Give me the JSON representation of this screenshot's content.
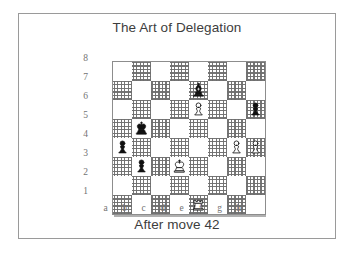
{
  "figure": {
    "title": "The Art of Delegation",
    "caption": "After move 42"
  },
  "board": {
    "files": [
      "a",
      "b",
      "c",
      "d",
      "e",
      "f",
      "g",
      "h"
    ],
    "ranks": [
      "8",
      "7",
      "6",
      "5",
      "4",
      "3",
      "2",
      "1"
    ],
    "light_square_color": "#ffffff",
    "dark_square_color": "#b8b8b8",
    "border_color": "#8d8d8d",
    "orientation": "white"
  },
  "chart_data": {
    "type": "table",
    "title": "The Art of Delegation",
    "subtitle": "After move 42",
    "xlabel": "file",
    "ylabel": "rank",
    "categories": [
      "a",
      "b",
      "c",
      "d",
      "e",
      "f",
      "g",
      "h"
    ],
    "x": [
      "a",
      "b",
      "c",
      "d",
      "e",
      "f",
      "g",
      "h"
    ],
    "values": [
      8,
      7,
      6,
      5,
      4,
      3,
      2,
      1
    ],
    "grid": true,
    "legend": "none",
    "pieces": [
      {
        "square": "e7",
        "file": "e",
        "rank": 7,
        "color": "black",
        "type": "bishop",
        "glyph": "♝"
      },
      {
        "square": "e6",
        "file": "e",
        "rank": 6,
        "color": "white",
        "type": "pawn",
        "glyph": "♙"
      },
      {
        "square": "h6",
        "file": "h",
        "rank": 6,
        "color": "black",
        "type": "pawn",
        "glyph": "♟"
      },
      {
        "square": "b5",
        "file": "b",
        "rank": 5,
        "color": "black",
        "type": "king",
        "glyph": "♚"
      },
      {
        "square": "a4",
        "file": "a",
        "rank": 4,
        "color": "black",
        "type": "pawn",
        "glyph": "♟"
      },
      {
        "square": "g4",
        "file": "g",
        "rank": 4,
        "color": "white",
        "type": "pawn",
        "glyph": "♙"
      },
      {
        "square": "h4",
        "file": "h",
        "rank": 4,
        "color": "white",
        "type": "pawn",
        "glyph": "♙"
      },
      {
        "square": "b3",
        "file": "b",
        "rank": 3,
        "color": "black",
        "type": "pawn",
        "glyph": "♟"
      },
      {
        "square": "d3",
        "file": "d",
        "rank": 3,
        "color": "white",
        "type": "king",
        "glyph": "♔"
      },
      {
        "square": "e1",
        "file": "e",
        "rank": 1,
        "color": "white",
        "type": "rook",
        "glyph": "♖"
      }
    ],
    "white_pieces": [
      "Ke3d3",
      "Re1",
      "Pe6",
      "Pg4",
      "Ph4"
    ],
    "black_pieces": [
      "Kb5",
      "Be7",
      "Pa4",
      "Pb3",
      "Ph6"
    ],
    "move_number": 42
  }
}
